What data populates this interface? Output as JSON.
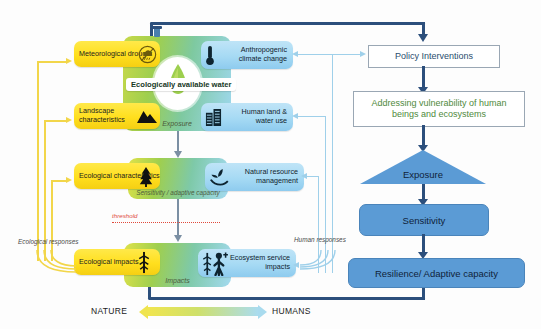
{
  "diagram": {
    "center": {
      "water_label": "Ecologically available water",
      "water_icon": "water-drop-icon"
    },
    "panels": [
      {
        "caption": "Exposure"
      },
      {
        "caption": "Sensitivity / adaptive capacity"
      },
      {
        "caption": "Impacts"
      }
    ],
    "threshold_label": "threshold",
    "nature_pills": [
      {
        "label": "Meteorological drought",
        "icon": "no-rain-cloud-icon"
      },
      {
        "label": "Landscape characteristics",
        "icon": "mountain-icon"
      },
      {
        "label": "Ecological characteristics",
        "icon": "conifer-tree-icon"
      },
      {
        "label": "Ecological impacts",
        "icon": "damaged-tree-icon"
      }
    ],
    "human_pills": [
      {
        "label": "Anthropogenic climate change",
        "icon": "thermometer-icon"
      },
      {
        "label": "Human land & water use",
        "icon": "city-buildings-icon"
      },
      {
        "label": "Natural resource management",
        "icon": "hand-plant-icon"
      },
      {
        "label": "Ecosystem service impacts",
        "icon": "person-tree-icon"
      }
    ],
    "side_captions": {
      "left": "Ecological responses",
      "right": "Human responses"
    },
    "end_labels": {
      "left": "NATURE",
      "right": "HUMANS"
    },
    "right_flow": {
      "policy": "Policy Interventions",
      "addressing": "Addressing vulnerability of human beings and ecosystems",
      "exposure": "Exposure",
      "sensitivity": "Sensitivity",
      "resilience": "Resilience/ Adaptive capacity"
    },
    "colors": {
      "yellow": "#ffdf1e",
      "blue_pill": "#a6daf4",
      "flow_blue": "#5b9bd5",
      "dark_line": "#2c4f7c",
      "green_text": "#4f8a3d",
      "policy_text": "#2a4d6e",
      "threshold_red": "#e0493b"
    }
  }
}
